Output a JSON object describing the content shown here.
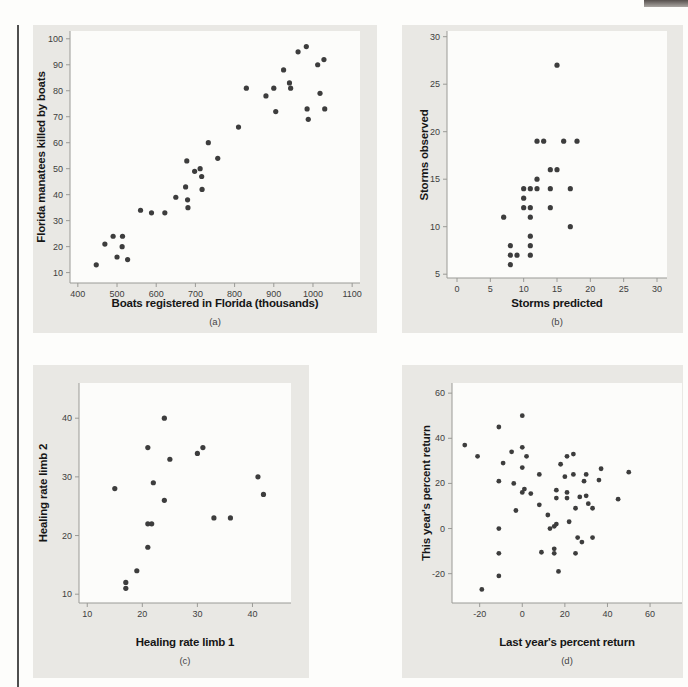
{
  "page": {
    "colors": {
      "background": "#fdfdfb",
      "panel_bg": "#e9e8e4",
      "plot_bg": "#fcfcfa",
      "dot": "#3d3d3d",
      "axis": "#9a9a96",
      "tick_label": "#3e3e3e",
      "axis_label": "#161616",
      "left_rule": "#4f4f4f",
      "corner_tab": "#56504d"
    }
  },
  "chart_data": [
    {
      "type": "scatter",
      "xlabel": "Boats registered in Florida (thousands)",
      "ylabel": "Florida manatees killed by boats",
      "caption": "(a)",
      "xlim": [
        380,
        1120
      ],
      "ylim": [
        6,
        103
      ],
      "xticks": [
        400,
        500,
        600,
        700,
        800,
        900,
        1000,
        1100
      ],
      "yticks": [
        10,
        20,
        30,
        40,
        50,
        60,
        70,
        80,
        90,
        100
      ],
      "grid": false,
      "legend": null,
      "points": [
        [
          447,
          13
        ],
        [
          469,
          21
        ],
        [
          490,
          24
        ],
        [
          500,
          16
        ],
        [
          513,
          20
        ],
        [
          514,
          24
        ],
        [
          527,
          15
        ],
        [
          560,
          34
        ],
        [
          588,
          33
        ],
        [
          622,
          33
        ],
        [
          650,
          39
        ],
        [
          675,
          43
        ],
        [
          678,
          53
        ],
        [
          680,
          38
        ],
        [
          681,
          35
        ],
        [
          698,
          49
        ],
        [
          712,
          50
        ],
        [
          716,
          47
        ],
        [
          717,
          42
        ],
        [
          733,
          60
        ],
        [
          757,
          54
        ],
        [
          810,
          66
        ],
        [
          830,
          81
        ],
        [
          880,
          78
        ],
        [
          900,
          81
        ],
        [
          905,
          72
        ],
        [
          925,
          88
        ],
        [
          940,
          83
        ],
        [
          943,
          81
        ],
        [
          962,
          95
        ],
        [
          983,
          97
        ],
        [
          985,
          73
        ],
        [
          988,
          69
        ],
        [
          1012,
          90
        ],
        [
          1018,
          79
        ],
        [
          1028,
          92
        ],
        [
          1030,
          73
        ]
      ]
    },
    {
      "type": "scatter",
      "xlabel": "Storms predicted",
      "ylabel": "Storms observed",
      "caption": "(b)",
      "xlim": [
        -1.5,
        31.5
      ],
      "ylim": [
        4.6,
        30.6
      ],
      "xticks": [
        0,
        5,
        10,
        15,
        20,
        25,
        30
      ],
      "yticks": [
        5,
        10,
        15,
        20,
        25,
        30
      ],
      "grid": false,
      "legend": null,
      "points": [
        [
          7,
          11
        ],
        [
          8,
          6
        ],
        [
          8,
          7
        ],
        [
          8,
          8
        ],
        [
          9,
          7
        ],
        [
          10,
          12
        ],
        [
          10,
          13
        ],
        [
          10,
          14
        ],
        [
          11,
          7
        ],
        [
          11,
          8
        ],
        [
          11,
          9
        ],
        [
          11,
          11
        ],
        [
          11,
          12
        ],
        [
          11,
          14
        ],
        [
          12,
          14
        ],
        [
          12,
          15
        ],
        [
          12,
          19
        ],
        [
          13,
          19
        ],
        [
          14,
          12
        ],
        [
          14,
          14
        ],
        [
          14,
          16
        ],
        [
          15,
          16
        ],
        [
          15,
          27
        ],
        [
          16,
          19
        ],
        [
          17,
          10
        ],
        [
          17,
          14
        ],
        [
          18,
          19
        ]
      ]
    },
    {
      "type": "scatter",
      "xlabel": "Healing rate limb 1",
      "ylabel": "Healing rate limb 2",
      "caption": "(c)",
      "xlim": [
        8.5,
        47
      ],
      "ylim": [
        8.5,
        46
      ],
      "xticks": [
        10,
        20,
        30,
        40
      ],
      "yticks": [
        10,
        20,
        30,
        40
      ],
      "grid": false,
      "legend": null,
      "points": [
        [
          15,
          28
        ],
        [
          17,
          11
        ],
        [
          17,
          12
        ],
        [
          19,
          14
        ],
        [
          21,
          18
        ],
        [
          21,
          22
        ],
        [
          21.7,
          22
        ],
        [
          21,
          35
        ],
        [
          22,
          29
        ],
        [
          24,
          26
        ],
        [
          24,
          40
        ],
        [
          25,
          33
        ],
        [
          30,
          34
        ],
        [
          31,
          35
        ],
        [
          33,
          23
        ],
        [
          36,
          23
        ],
        [
          41,
          30
        ],
        [
          42,
          27
        ]
      ]
    },
    {
      "type": "scatter",
      "xlabel": "Last year's percent return",
      "ylabel": "This year's percent return",
      "caption": "(d)",
      "xlim": [
        -33,
        75
      ],
      "ylim": [
        -33,
        64.5
      ],
      "xticks": [
        -20,
        0,
        20,
        40,
        60
      ],
      "yticks": [
        -20,
        0,
        20,
        40,
        60
      ],
      "grid": false,
      "legend": null,
      "points": [
        [
          -27,
          37
        ],
        [
          -21,
          32
        ],
        [
          -19,
          -27
        ],
        [
          -11,
          45
        ],
        [
          -11,
          21
        ],
        [
          -11,
          0
        ],
        [
          -11,
          -11
        ],
        [
          -11,
          -21
        ],
        [
          -9,
          29
        ],
        [
          -5,
          34
        ],
        [
          -4,
          20
        ],
        [
          -3,
          8
        ],
        [
          0,
          50
        ],
        [
          0,
          36
        ],
        [
          0,
          27
        ],
        [
          0,
          16
        ],
        [
          1,
          17.5
        ],
        [
          2,
          32
        ],
        [
          4,
          15.5
        ],
        [
          8,
          24
        ],
        [
          8,
          10.5
        ],
        [
          9,
          -10.5
        ],
        [
          12,
          6
        ],
        [
          13,
          0
        ],
        [
          15,
          1
        ],
        [
          15,
          -9
        ],
        [
          15,
          -11
        ],
        [
          16,
          2
        ],
        [
          16,
          17
        ],
        [
          16,
          13.5
        ],
        [
          17,
          -19
        ],
        [
          18,
          28.5
        ],
        [
          20,
          23
        ],
        [
          21,
          32
        ],
        [
          21,
          16
        ],
        [
          21,
          13.5
        ],
        [
          22,
          3
        ],
        [
          24,
          33
        ],
        [
          24,
          24
        ],
        [
          25,
          9
        ],
        [
          25,
          -11
        ],
        [
          26,
          -4
        ],
        [
          27,
          14
        ],
        [
          28,
          -6
        ],
        [
          29,
          21
        ],
        [
          30,
          24
        ],
        [
          30,
          14.5
        ],
        [
          31,
          11
        ],
        [
          33,
          9
        ],
        [
          33,
          -4
        ],
        [
          36,
          21.5
        ],
        [
          37,
          26.5
        ],
        [
          45,
          13
        ],
        [
          50,
          25
        ]
      ]
    }
  ]
}
